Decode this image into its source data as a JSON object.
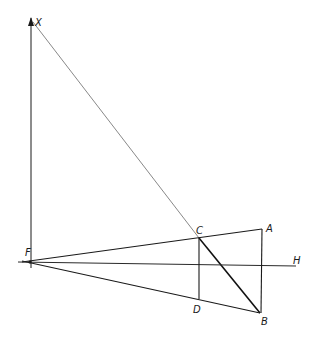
{
  "diagram": {
    "type": "geometric-construction",
    "background": "#ffffff",
    "line_color": "#1a1a1a",
    "points": {
      "X": {
        "label": "X",
        "x": 31,
        "y": 20
      },
      "F": {
        "label": "F",
        "x": 30,
        "y": 262
      },
      "C": {
        "label": "C",
        "x": 199,
        "y": 238
      },
      "A": {
        "label": "A",
        "x": 262,
        "y": 229
      },
      "D": {
        "label": "D",
        "x": 199,
        "y": 299
      },
      "B": {
        "label": "B",
        "x": 260,
        "y": 313
      },
      "H": {
        "label": "H",
        "x": 296,
        "y": 266
      }
    },
    "labels": {
      "X": "X",
      "F": "F",
      "C": "C",
      "A": "A",
      "D": "D",
      "B": "B",
      "H": "H"
    },
    "segments": [
      {
        "from": "F",
        "to": "X",
        "style": "arrow"
      },
      {
        "from": "X",
        "to": "C",
        "style": "thin"
      },
      {
        "from": "C",
        "to": "B",
        "style": "thick"
      },
      {
        "from": "F",
        "to": "A",
        "style": "normal"
      },
      {
        "from": "F",
        "to": "B",
        "style": "normal"
      },
      {
        "from": "F",
        "to": "H",
        "style": "normal"
      },
      {
        "from": "C",
        "to": "D",
        "style": "normal"
      },
      {
        "from": "A",
        "to": "B",
        "style": "normal"
      }
    ]
  }
}
